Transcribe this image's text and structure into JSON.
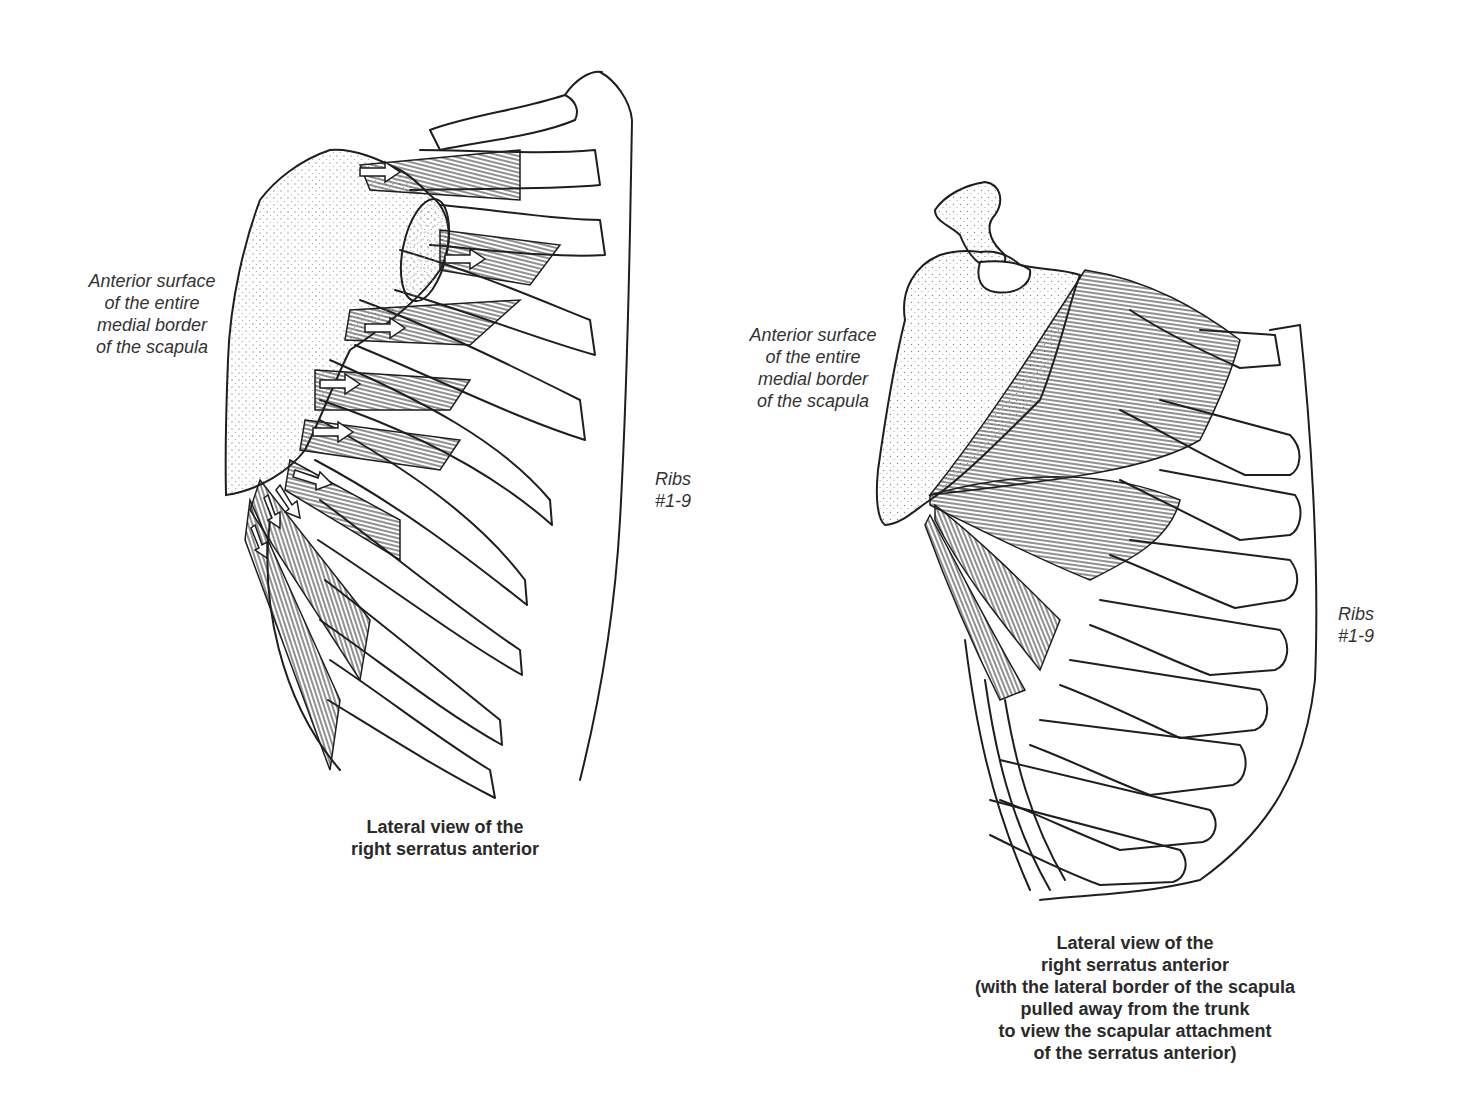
{
  "figures": [
    {
      "id": "left",
      "side_label_lines": [
        "Anterior surface",
        "of the entire",
        "medial border",
        "of the scapula"
      ],
      "ribs_label_lines": [
        "Ribs",
        "#1-9"
      ],
      "caption_lines": [
        "Lateral view of the",
        "right serratus anterior"
      ],
      "arrows_count": 9
    },
    {
      "id": "right",
      "side_label_lines": [
        "Anterior surface",
        "of the entire",
        "medial border",
        "of the scapula"
      ],
      "ribs_label_lines": [
        "Ribs",
        "#1-9"
      ],
      "caption_lines": [
        "Lateral view of the",
        "right serratus anterior",
        "(with the lateral border of the scapula",
        "pulled away from the trunk",
        "to view the scapular attachment",
        "of the serratus anterior)"
      ]
    }
  ],
  "colors": {
    "ink": "#1e1e1e",
    "text": "#2a2a2a",
    "stipple": "#8a8a8a",
    "background": "#ffffff"
  }
}
